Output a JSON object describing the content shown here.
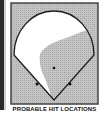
{
  "figure": {
    "caption": "PROBABLE HIT LOCATIONS",
    "colors": {
      "background_field": "#b9b9b9",
      "fair_territory": "#ffffff",
      "hit_zone": "#bdbdbd",
      "outline": "#222222",
      "frame": "#555555"
    },
    "markers": [
      {
        "name": "pitcher-mound",
        "x": 44,
        "y": 66
      },
      {
        "name": "first-base",
        "x": 60,
        "y": 82
      },
      {
        "name": "third-base",
        "x": 27,
        "y": 82
      }
    ]
  }
}
